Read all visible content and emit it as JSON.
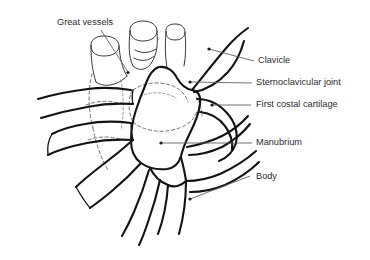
{
  "figure": {
    "background_color": "#ffffff",
    "line_color": "#121212",
    "leader_color": "#58585a",
    "hidden_line_color": "#6a6a6a",
    "label_color": "#2b2b2b"
  },
  "labels": {
    "great_vessels": "Great vessels",
    "clavicle": "Clavicle",
    "sternoclavicular_joint": "Sternoclavicular joint",
    "first_costal_cartilage": "First costal cartilage",
    "manubrium": "Manubrium",
    "body": "Body"
  },
  "annotations": [
    {
      "name": "great-vessels",
      "label": "Great vessels",
      "label_x": 57,
      "label_y": 23,
      "anchor": "start",
      "leader": "M 101 30 L 128 72",
      "dot_x": 128,
      "dot_y": 72.5
    },
    {
      "name": "clavicle",
      "label": "Clavicle",
      "label_x": 258,
      "label_y": 61,
      "anchor": "start",
      "leader": "M 209 49 L 254 61",
      "dot_x": 209,
      "dot_y": 49
    },
    {
      "name": "sternoclavicular-joint",
      "label": "Sternoclavicular joint",
      "label_x": 256,
      "label_y": 83,
      "anchor": "start",
      "leader": "M 190 82 L 252 83",
      "dot_x": 190,
      "dot_y": 82
    },
    {
      "name": "first-costal-cartilage",
      "label": "First costal cartilage",
      "label_x": 256,
      "label_y": 105,
      "anchor": "start",
      "leader": "M 212 105 L 251 105",
      "dot_x": 212,
      "dot_y": 105
    },
    {
      "name": "manubrium",
      "label": "Manubrium",
      "label_x": 256,
      "label_y": 143,
      "anchor": "start",
      "leader": "M 161 143 L 252 143",
      "dot_x": 161,
      "dot_y": 143
    },
    {
      "name": "body",
      "label": "Body",
      "label_x": 256,
      "label_y": 177,
      "anchor": "start",
      "leader": "M 190 199 L 250 176",
      "dot_x": 190,
      "dot_y": 199
    }
  ],
  "structures": [
    {
      "name": "great-vessel-left",
      "kind": "vessel"
    },
    {
      "name": "great-vessel-middle",
      "kind": "vessel"
    },
    {
      "name": "great-vessel-right",
      "kind": "vessel"
    },
    {
      "name": "manubrium-outline",
      "kind": "bone"
    },
    {
      "name": "sternum-body-outline",
      "kind": "bone"
    },
    {
      "name": "clavicle-right",
      "kind": "bone"
    },
    {
      "name": "clavicle-left",
      "kind": "bone"
    },
    {
      "name": "first-costal-cartilage-right",
      "kind": "bone"
    },
    {
      "name": "first-rib-left",
      "kind": "bone"
    },
    {
      "name": "second-rib-left",
      "kind": "bone"
    },
    {
      "name": "second-costal-cartilage-right",
      "kind": "bone"
    },
    {
      "name": "third-costal-cartilage-right",
      "kind": "bone"
    },
    {
      "name": "hidden-outlines",
      "kind": "hidden"
    }
  ]
}
